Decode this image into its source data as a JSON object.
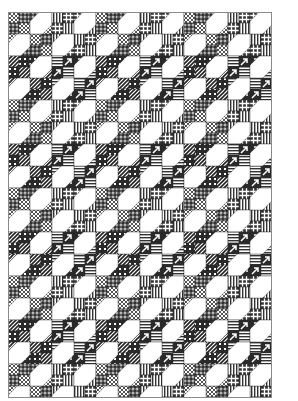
{
  "quilt": {
    "title": "",
    "columns": 6,
    "rows": 9,
    "block_size": 44,
    "width": 264,
    "height": 386,
    "colors": {
      "background": "#ffffff",
      "ink": "#2a2a2a",
      "border": "#8a8a8a"
    },
    "bands": [
      {
        "style": "light",
        "patterns_a": [
          "crosshatch",
          "plaid"
        ],
        "patterns_b": [
          "vstripes",
          "grid"
        ]
      },
      {
        "style": "dark",
        "patterns_a": [
          "dstripes",
          "dots"
        ],
        "patterns_b": [
          "hstripes",
          "arrows"
        ]
      }
    ],
    "block": {
      "name": "Snowball Four-Patch",
      "cells": [
        "four-patch",
        "white-snowball",
        "white-snowball",
        "four-patch"
      ]
    }
  }
}
